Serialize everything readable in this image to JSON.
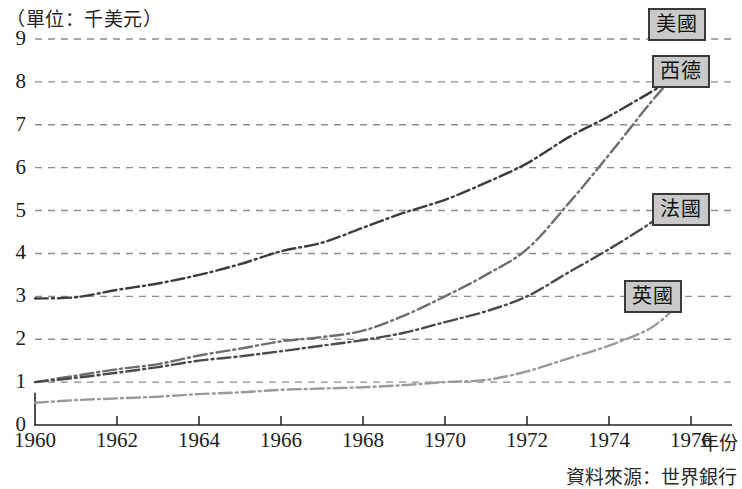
{
  "chart_data": {
    "type": "line",
    "title": "（單位：千美元）",
    "xlabel": "年份",
    "ylabel": "",
    "unit_note": "（單位：千美元）",
    "source": "資料來源：世界銀行",
    "grid": true,
    "legend_position": "inline-right",
    "xlim": [
      1960,
      1977
    ],
    "ylim": [
      0,
      9
    ],
    "yticks": [
      0,
      1,
      2,
      3,
      4,
      5,
      6,
      7,
      8,
      9
    ],
    "xticks": [
      1960,
      1962,
      1964,
      1966,
      1968,
      1970,
      1972,
      1974,
      1976
    ],
    "xtick_labels": [
      "1960",
      "1962",
      "1964",
      "1966",
      "1968",
      "1970",
      "1972",
      "1974",
      "1976"
    ],
    "ytick_labels": [
      "0",
      "1",
      "2",
      "3",
      "4",
      "5",
      "6",
      "7",
      "8",
      "9"
    ],
    "x": [
      1960,
      1961,
      1962,
      1963,
      1964,
      1965,
      1966,
      1967,
      1968,
      1969,
      1970,
      1971,
      1972,
      1973,
      1974,
      1975,
      1975.6
    ],
    "series": [
      {
        "name": "美國",
        "label": "美國",
        "color": "#3c3c3c",
        "style": "dash-dot",
        "values": [
          2.95,
          2.98,
          3.15,
          3.3,
          3.5,
          3.75,
          4.05,
          4.25,
          4.6,
          4.95,
          5.25,
          5.65,
          6.1,
          6.7,
          7.2,
          7.75,
          8.1
        ]
      },
      {
        "name": "西德",
        "label": "西德",
        "color": "#6e6e6e",
        "style": "dash-dot",
        "values": [
          1.0,
          1.15,
          1.3,
          1.42,
          1.62,
          1.78,
          1.95,
          2.05,
          2.2,
          2.55,
          3.0,
          3.5,
          4.1,
          5.15,
          6.3,
          7.5,
          8.15
        ]
      },
      {
        "name": "法國",
        "label": "法國",
        "color": "#4a4a4a",
        "style": "dash-dot",
        "values": [
          1.0,
          1.1,
          1.22,
          1.35,
          1.5,
          1.6,
          1.72,
          1.85,
          1.98,
          2.15,
          2.4,
          2.65,
          3.0,
          3.55,
          4.1,
          4.7,
          5.15
        ]
      },
      {
        "name": "英國",
        "label": "英國",
        "color": "#9a9a9a",
        "style": "dash-dot",
        "values": [
          0.52,
          0.58,
          0.62,
          0.66,
          0.72,
          0.76,
          0.82,
          0.85,
          0.88,
          0.93,
          1.0,
          1.05,
          1.25,
          1.55,
          1.85,
          2.25,
          2.72
        ]
      }
    ]
  },
  "labels": {
    "us": "美國",
    "west_germany": "西德",
    "france": "法國",
    "uk": "英國"
  }
}
